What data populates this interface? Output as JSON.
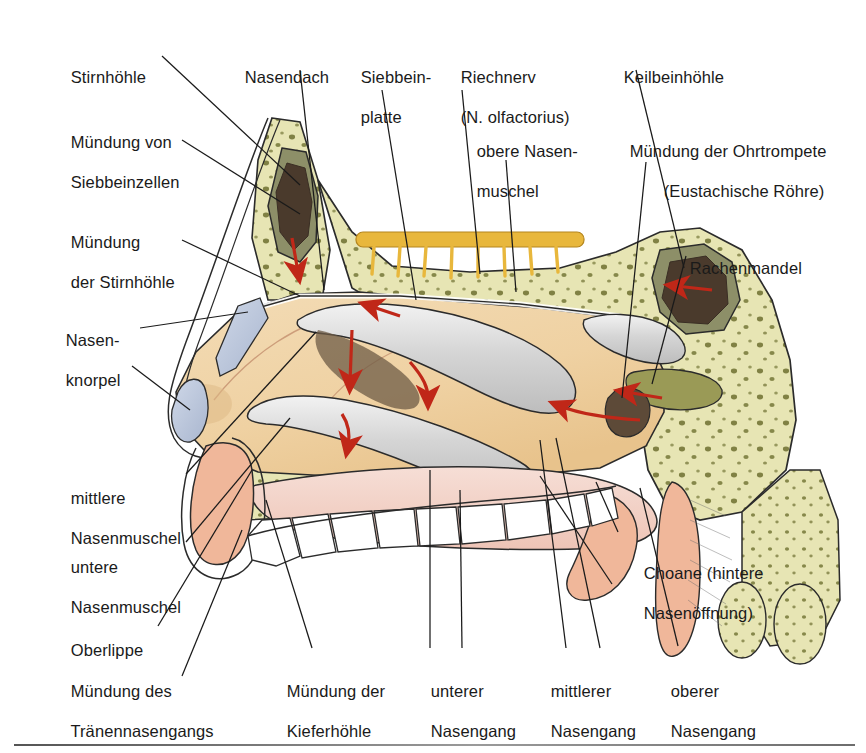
{
  "figure": {
    "language": "de",
    "background_color": "#ffffff",
    "rule_color": "#6d6d6d"
  },
  "palette": {
    "bone_cancellous": "#e7e5b4",
    "bone_outline": "#2b2b2b",
    "bone_speck": "#6e7030",
    "mucosa_tan": "#f0d2a4",
    "mucosa_tan_dark": "#e3bd86",
    "concha_grey": "#d8d8d8",
    "cartilage_blue": "#b9c4da",
    "soft_tissue_pink": "#f0b79a",
    "palate_pink": "#f2cfc6",
    "sinus_dark": "#4a3a2c",
    "sinus_olive": "#8d8f68",
    "olfactory_yellow": "#e8b73c",
    "arrow_red": "#c02718",
    "tooth_white": "#ffffff",
    "adenoid_olive": "#9a9a56",
    "leader_line": "#1a1a1a"
  },
  "labels": [
    {
      "id": "stirnhoehle",
      "lines": [
        "Stirnhöhle"
      ],
      "x": 52,
      "y": 47,
      "align": "left"
    },
    {
      "id": "muendung-siebbeinzellen",
      "lines": [
        "Mündung von",
        "Siebbeinzellen"
      ],
      "x": 52,
      "y": 112,
      "align": "left"
    },
    {
      "id": "muendung-stirnhoehle",
      "lines": [
        "Mündung",
        "der Stirnhöhle"
      ],
      "x": 52,
      "y": 212,
      "align": "left"
    },
    {
      "id": "nasenknorpel",
      "lines": [
        "Nasen-",
        "knorpel"
      ],
      "x": 47,
      "y": 310,
      "align": "left"
    },
    {
      "id": "mittlere-nasenmuschel",
      "lines": [
        "mittlere",
        "Nasenmuschel"
      ],
      "x": 52,
      "y": 468,
      "align": "left"
    },
    {
      "id": "untere-nasenmuschel",
      "lines": [
        "untere",
        "Nasenmuschel"
      ],
      "x": 52,
      "y": 537,
      "align": "left"
    },
    {
      "id": "oberlippe",
      "lines": [
        "Oberlippe"
      ],
      "x": 52,
      "y": 620,
      "align": "left"
    },
    {
      "id": "muendung-traenennasengangs",
      "lines": [
        "Mündung des",
        "Tränennasengangs"
      ],
      "x": 52,
      "y": 661,
      "align": "left"
    },
    {
      "id": "nasendach",
      "lines": [
        "Nasendach"
      ],
      "x": 226,
      "y": 47,
      "align": "left"
    },
    {
      "id": "siebbeinplatte",
      "lines": [
        "Siebbein-",
        "platte"
      ],
      "x": 342,
      "y": 47,
      "align": "left"
    },
    {
      "id": "riechnerv",
      "lines": [
        "Riechnerv",
        "(N. olfactorius)"
      ],
      "x": 442,
      "y": 47,
      "align": "left"
    },
    {
      "id": "obere-nasenmuschel",
      "lines": [
        "obere Nasen-",
        "muschel"
      ],
      "x": 458,
      "y": 121,
      "align": "left"
    },
    {
      "id": "keilbeinhoehle",
      "lines": [
        "Keilbeinhöhle"
      ],
      "x": 605,
      "y": 47,
      "align": "left"
    },
    {
      "id": "muendung-ohrtrompete",
      "lines": [
        "Mündung der Ohrtrompete",
        "(Eustachische Röhre)"
      ],
      "x": 611,
      "y": 121,
      "align": "left"
    },
    {
      "id": "rachenmandel",
      "lines": [
        "Rachenmandel"
      ],
      "x": 671,
      "y": 238,
      "align": "left"
    },
    {
      "id": "choane",
      "lines": [
        "Choane (hintere",
        "Nasenöffnung)"
      ],
      "x": 625,
      "y": 543,
      "align": "left"
    },
    {
      "id": "muendung-kieferhoehle",
      "lines": [
        "Mündung der",
        "Kieferhöhle"
      ],
      "x": 268,
      "y": 661,
      "align": "left"
    },
    {
      "id": "unterer-nasengang",
      "lines": [
        "unterer",
        "Nasengang"
      ],
      "x": 412,
      "y": 661,
      "align": "left"
    },
    {
      "id": "mittlerer-nasengang",
      "lines": [
        "mittlerer",
        "Nasengang"
      ],
      "x": 532,
      "y": 661,
      "align": "left"
    },
    {
      "id": "oberer-nasengang",
      "lines": [
        "oberer",
        "Nasengang"
      ],
      "x": 652,
      "y": 661,
      "align": "left"
    }
  ],
  "anatomy_parts": [
    "Stirnhöhle (Sinus frontalis)",
    "Siebbeinplatte (Lamina cribrosa)",
    "Riechnerv (N. olfactorius)",
    "obere Nasenmuschel (Concha nasalis superior)",
    "mittlere Nasenmuschel (Concha nasalis media)",
    "untere Nasenmuschel (Concha nasalis inferior)",
    "Keilbeinhöhle (Sinus sphenoidalis)",
    "Rachenmandel (Tonsilla pharyngealis)",
    "Mündung der Ohrtrompete (Tuba auditiva)",
    "Choane",
    "Nasenknorpel",
    "Oberlippe",
    "Gaumen und Zähne"
  ]
}
